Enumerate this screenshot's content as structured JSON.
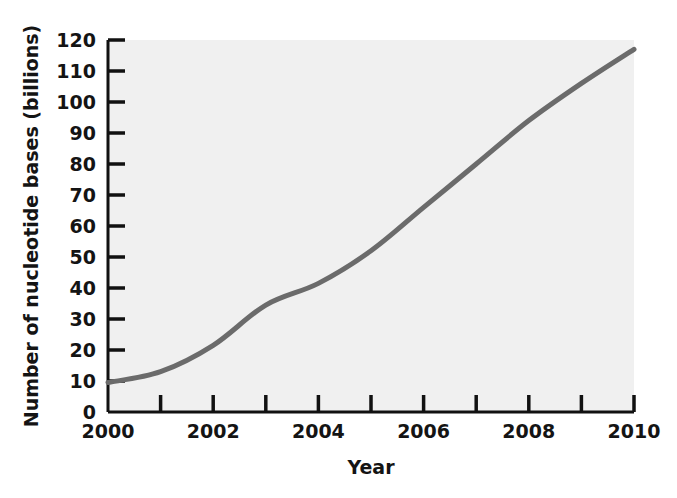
{
  "chart_data": {
    "type": "line",
    "title": "",
    "xlabel": "Year",
    "ylabel": "Number of nucleotide bases (billions)",
    "x": [
      2000,
      2001,
      2002,
      2003,
      2004,
      2005,
      2006,
      2007,
      2008,
      2009,
      2010
    ],
    "values": [
      9.5,
      13,
      21.5,
      34.5,
      41.5,
      52,
      66,
      80,
      94,
      106,
      117
    ],
    "xlim": [
      2000,
      2010
    ],
    "ylim": [
      0,
      120
    ],
    "x_tick_values": [
      2000,
      2001,
      2002,
      2003,
      2004,
      2005,
      2006,
      2007,
      2008,
      2009,
      2010
    ],
    "x_tick_labels": [
      "2000",
      "",
      "2002",
      "",
      "2004",
      "",
      "2006",
      "",
      "2008",
      "",
      "2010"
    ],
    "y_ticks": [
      0,
      10,
      20,
      30,
      40,
      50,
      60,
      70,
      80,
      90,
      100,
      110,
      120
    ],
    "y_tick_labels": [
      "0",
      "10",
      "20",
      "30",
      "40",
      "50",
      "60",
      "70",
      "80",
      "90",
      "100",
      "110",
      "120"
    ],
    "grid": false,
    "legend": null,
    "series_color": "#6b6b6b",
    "plot_background": "#f0f0f0",
    "axis_color": "#111111"
  }
}
